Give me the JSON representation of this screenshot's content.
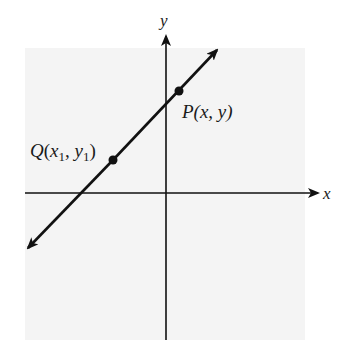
{
  "figure": {
    "background_color": "#f4f4f4",
    "line_color": "#111111",
    "axes": {
      "x_label": "x",
      "y_label": "y"
    },
    "line": {
      "description": "Straight line with arrows on both ends, positive slope, passing through Q and P"
    },
    "points": [
      {
        "id": "P",
        "label": "P(x, y)",
        "label_name": "P",
        "label_coords": "(x, y)"
      },
      {
        "id": "Q",
        "label": "Q(x1, y1)",
        "label_name": "Q",
        "label_x": "x",
        "label_x_sub": "1",
        "label_sep": ", ",
        "label_y": "y",
        "label_y_sub": "1"
      }
    ]
  }
}
